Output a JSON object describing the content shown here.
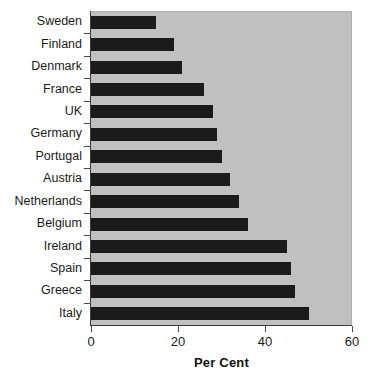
{
  "chart_data": {
    "type": "bar",
    "orientation": "horizontal",
    "title": "",
    "xlabel": "Per Cent",
    "ylabel": "",
    "xlim": [
      0,
      60
    ],
    "xticks": [
      0,
      20,
      40,
      60
    ],
    "xtick_labels": [
      "0",
      "20",
      "40",
      "60"
    ],
    "grid": false,
    "legend": null,
    "categories": [
      "Sweden",
      "Finland",
      "Denmark",
      "France",
      "UK",
      "Germany",
      "Portugal",
      "Austria",
      "Netherlands",
      "Belgium",
      "Ireland",
      "Spain",
      "Greece",
      "Italy"
    ],
    "values": [
      15,
      19,
      21,
      26,
      28,
      29,
      30,
      32,
      34,
      36,
      45,
      46,
      47,
      50
    ],
    "bar_color": "#1b1b1b",
    "plot_background": "#c0c0c0",
    "page_background": "#ffffff"
  }
}
